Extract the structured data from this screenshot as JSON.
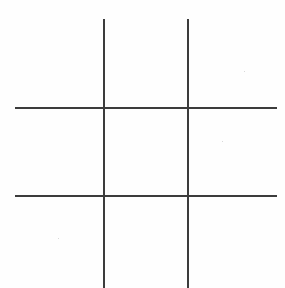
{
  "board": {
    "title": "Tic-Tac-Toe Grid",
    "description": "Empty three-by-three tic-tac-toe grid drawn with two vertical and two horizontal hand-drawn strokes",
    "background_color": "#fefefe",
    "line_color": "#3c3c3c",
    "line_width_px": 2,
    "rows": 3,
    "columns": 3,
    "lines": [
      {
        "name": "vertical-left",
        "orientation": "vertical",
        "x": 103,
        "y": 19,
        "length": 269
      },
      {
        "name": "vertical-right",
        "orientation": "vertical",
        "x": 187,
        "y": 19,
        "length": 269
      },
      {
        "name": "horizontal-top",
        "orientation": "horizontal",
        "x": 15,
        "y": 107,
        "length": 262
      },
      {
        "name": "horizontal-bottom",
        "orientation": "horizontal",
        "x": 15,
        "y": 195,
        "length": 262
      }
    ],
    "cells": [
      {
        "index": 0,
        "position": "top-left",
        "mark": ""
      },
      {
        "index": 1,
        "position": "top-center",
        "mark": ""
      },
      {
        "index": 2,
        "position": "top-right",
        "mark": ""
      },
      {
        "index": 3,
        "position": "middle-left",
        "mark": ""
      },
      {
        "index": 4,
        "position": "middle-center",
        "mark": ""
      },
      {
        "index": 5,
        "position": "middle-right",
        "mark": ""
      },
      {
        "index": 6,
        "position": "bottom-left",
        "mark": ""
      },
      {
        "index": 7,
        "position": "bottom-center",
        "mark": ""
      },
      {
        "index": 8,
        "position": "bottom-right",
        "mark": ""
      }
    ]
  }
}
